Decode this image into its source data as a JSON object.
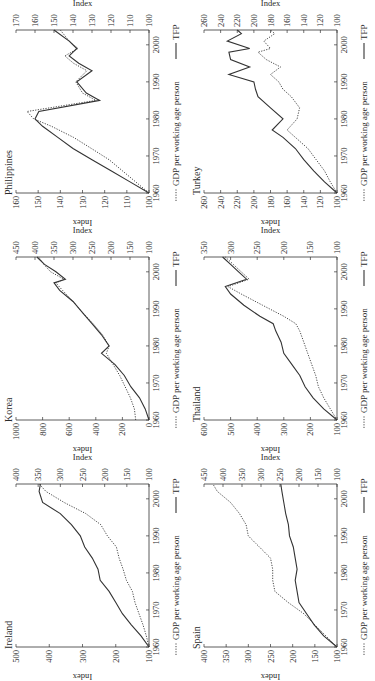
{
  "figure": {
    "orientation": "rotated 90deg counter-clockwise",
    "legend": {
      "dotted_label": "GDP per working age person",
      "solid_label": "TFP"
    },
    "left_axis_label": "Index",
    "right_axis_label": "Index",
    "colors": {
      "line": "#333333",
      "axis": "#333333",
      "background": "#ffffff"
    }
  },
  "chart_data": [
    {
      "type": "line",
      "title": "Ireland",
      "xlabel": "",
      "x_ticks": [
        1960,
        1970,
        1980,
        1990,
        2000
      ],
      "x_range": [
        1960,
        2004
      ],
      "left_axis": {
        "label": "Index",
        "range": [
          100,
          500
        ],
        "ticks": [
          100,
          200,
          300,
          400,
          500
        ],
        "series": "GDP per working age person"
      },
      "right_axis": {
        "label": "Index",
        "range": [
          100,
          400
        ],
        "ticks": [
          100,
          150,
          200,
          250,
          300,
          350,
          400
        ],
        "series": "TFP"
      },
      "series": [
        {
          "name": "GDP per working age person",
          "style": "dotted",
          "axis": "left",
          "x": [
            1960,
            1963,
            1966,
            1969,
            1972,
            1975,
            1978,
            1981,
            1984,
            1987,
            1990,
            1993,
            1996,
            1999,
            2002,
            2004
          ],
          "values": [
            100,
            108,
            118,
            130,
            142,
            150,
            168,
            178,
            190,
            198,
            225,
            245,
            290,
            355,
            410,
            430
          ]
        },
        {
          "name": "TFP",
          "style": "solid",
          "axis": "right",
          "x": [
            1960,
            1963,
            1966,
            1969,
            1972,
            1975,
            1978,
            1981,
            1984,
            1987,
            1990,
            1993,
            1996,
            1999,
            2002,
            2004
          ],
          "values": [
            100,
            118,
            140,
            160,
            175,
            190,
            210,
            215,
            228,
            245,
            255,
            275,
            300,
            340,
            348,
            345
          ]
        }
      ]
    },
    {
      "type": "line",
      "title": "Korea",
      "x_ticks": [
        1960,
        1970,
        1980,
        1990,
        2000
      ],
      "x_range": [
        1960,
        2004
      ],
      "left_axis": {
        "label": "Index",
        "range": [
          0,
          1000
        ],
        "ticks": [
          0,
          200,
          400,
          600,
          800,
          1000
        ],
        "series": "GDP per working age person"
      },
      "right_axis": {
        "label": "Index",
        "range": [
          100,
          450
        ],
        "ticks": [
          100,
          150,
          200,
          250,
          300,
          350,
          400,
          450
        ],
        "series": "TFP"
      },
      "series": [
        {
          "name": "GDP per working age person",
          "style": "dotted",
          "axis": "left",
          "x": [
            1960,
            1963,
            1966,
            1969,
            1972,
            1975,
            1978,
            1980,
            1983,
            1986,
            1989,
            1992,
            1995,
            1997,
            1998,
            2000,
            2002,
            2004
          ],
          "values": [
            100,
            110,
            140,
            180,
            220,
            270,
            320,
            300,
            350,
            420,
            500,
            570,
            650,
            700,
            640,
            740,
            790,
            830
          ]
        },
        {
          "name": "TFP",
          "style": "solid",
          "axis": "right",
          "x": [
            1960,
            1963,
            1966,
            1969,
            1972,
            1975,
            1978,
            1980,
            1983,
            1986,
            1989,
            1992,
            1995,
            1997,
            1998,
            2000,
            2002,
            2004
          ],
          "values": [
            100,
            110,
            125,
            148,
            165,
            190,
            225,
            205,
            225,
            250,
            275,
            300,
            335,
            350,
            320,
            345,
            375,
            395
          ]
        }
      ]
    },
    {
      "type": "line",
      "title": "Philippines",
      "x_ticks": [
        1960,
        1970,
        1980,
        1990,
        2000
      ],
      "x_range": [
        1960,
        2004
      ],
      "left_axis": {
        "label": "Index",
        "range": [
          100,
          160
        ],
        "ticks": [
          100,
          110,
          120,
          130,
          140,
          150,
          160
        ],
        "series": "GDP per working age person"
      },
      "right_axis": {
        "label": "Index",
        "range": [
          100,
          170
        ],
        "ticks": [
          100,
          110,
          120,
          130,
          140,
          150,
          160,
          170
        ],
        "series": "TFP"
      },
      "series": [
        {
          "name": "GDP per working age person",
          "style": "dotted",
          "axis": "left",
          "x": [
            1960,
            1963,
            1966,
            1969,
            1972,
            1975,
            1978,
            1980,
            1982,
            1985,
            1987,
            1990,
            1993,
            1995,
            1997,
            1999,
            2001,
            2004
          ],
          "values": [
            100,
            106,
            112,
            118,
            126,
            134,
            144,
            152,
            155,
            124,
            130,
            133,
            128,
            134,
            138,
            132,
            136,
            140
          ]
        },
        {
          "name": "TFP",
          "style": "solid",
          "axis": "right",
          "x": [
            1960,
            1963,
            1966,
            1969,
            1972,
            1975,
            1978,
            1980,
            1982,
            1985,
            1987,
            1990,
            1993,
            1995,
            1997,
            1999,
            2001,
            2004
          ],
          "values": [
            100,
            110,
            120,
            130,
            140,
            148,
            156,
            160,
            158,
            126,
            133,
            138,
            130,
            137,
            142,
            138,
            142,
            150
          ]
        }
      ]
    },
    {
      "type": "line",
      "title": "Spain",
      "x_ticks": [
        1960,
        1970,
        1980,
        1990,
        2000
      ],
      "x_range": [
        1960,
        2004
      ],
      "left_axis": {
        "label": "Index",
        "range": [
          100,
          400
        ],
        "ticks": [
          100,
          150,
          200,
          250,
          300,
          350,
          400
        ],
        "series": "GDP per working age person"
      },
      "right_axis": {
        "label": "Index",
        "range": [
          100,
          450
        ],
        "ticks": [
          100,
          150,
          200,
          250,
          300,
          350,
          400,
          450
        ],
        "series": "TFP"
      },
      "series": [
        {
          "name": "GDP per working age person",
          "style": "dotted",
          "axis": "left",
          "x": [
            1960,
            1963,
            1966,
            1969,
            1972,
            1975,
            1978,
            1981,
            1984,
            1987,
            1990,
            1993,
            1996,
            1999,
            2002,
            2004
          ],
          "values": [
            100,
            125,
            150,
            175,
            210,
            240,
            245,
            245,
            250,
            275,
            300,
            305,
            320,
            340,
            370,
            380
          ]
        },
        {
          "name": "TFP",
          "style": "solid",
          "axis": "right",
          "x": [
            1960,
            1963,
            1966,
            1969,
            1972,
            1975,
            1978,
            1981,
            1984,
            1987,
            1990,
            1993,
            1996,
            1999,
            2002,
            2004
          ],
          "values": [
            100,
            135,
            160,
            180,
            200,
            205,
            210,
            205,
            210,
            215,
            225,
            228,
            235,
            240,
            245,
            248
          ]
        }
      ]
    },
    {
      "type": "line",
      "title": "Thailand",
      "x_ticks": [
        1960,
        1970,
        1980,
        1990,
        2000
      ],
      "x_range": [
        1960,
        2004
      ],
      "left_axis": {
        "label": "Index",
        "range": [
          100,
          600
        ],
        "ticks": [
          100,
          200,
          300,
          400,
          500,
          600
        ],
        "series": "GDP per working age person"
      },
      "right_axis": {
        "label": "Index",
        "range": [
          100,
          350
        ],
        "ticks": [
          100,
          150,
          200,
          250,
          300,
          350
        ],
        "series": "TFP"
      },
      "series": [
        {
          "name": "GDP per working age person",
          "style": "dotted",
          "axis": "left",
          "x": [
            1960,
            1963,
            1966,
            1969,
            1972,
            1975,
            1978,
            1981,
            1984,
            1986,
            1988,
            1991,
            1994,
            1996,
            1998,
            2000,
            2002,
            2004
          ],
          "values": [
            100,
            125,
            150,
            170,
            180,
            195,
            210,
            225,
            240,
            255,
            300,
            380,
            460,
            510,
            430,
            460,
            490,
            520
          ]
        },
        {
          "name": "TFP",
          "style": "solid",
          "axis": "right",
          "x": [
            1960,
            1963,
            1966,
            1969,
            1972,
            1975,
            1978,
            1981,
            1984,
            1986,
            1988,
            1991,
            1994,
            1996,
            1998,
            2000,
            2002,
            2004
          ],
          "values": [
            100,
            125,
            145,
            160,
            170,
            185,
            200,
            205,
            215,
            220,
            245,
            275,
            300,
            310,
            270,
            285,
            300,
            315
          ]
        }
      ]
    },
    {
      "type": "line",
      "title": "Turkey",
      "x_ticks": [
        1960,
        1970,
        1980,
        1990,
        2000
      ],
      "x_range": [
        1960,
        2004
      ],
      "left_axis": {
        "label": "Index",
        "range": [
          100,
          260
        ],
        "ticks": [
          100,
          120,
          140,
          160,
          180,
          200,
          220,
          240,
          260
        ],
        "series": "GDP per working age person"
      },
      "right_axis": {
        "label": "Index",
        "range": [
          100,
          260
        ],
        "ticks": [
          100,
          120,
          140,
          160,
          180,
          200,
          220,
          240,
          260
        ],
        "series": "TFP"
      },
      "series": [
        {
          "name": "GDP per working age person",
          "style": "dotted",
          "axis": "left",
          "x": [
            1960,
            1963,
            1966,
            1969,
            1972,
            1975,
            1977,
            1980,
            1983,
            1986,
            1988,
            1990,
            1992,
            1994,
            1996,
            1998,
            1999,
            2001,
            2003,
            2004
          ],
          "values": [
            100,
            108,
            115,
            125,
            135,
            150,
            160,
            148,
            145,
            155,
            165,
            170,
            180,
            168,
            185,
            195,
            180,
            188,
            175,
            180
          ]
        },
        {
          "name": "TFP",
          "style": "solid",
          "axis": "right",
          "x": [
            1960,
            1963,
            1966,
            1969,
            1972,
            1975,
            1977,
            1980,
            1983,
            1986,
            1988,
            1990,
            1992,
            1994,
            1996,
            1998,
            1999,
            2001,
            2003,
            2004
          ],
          "values": [
            100,
            115,
            128,
            140,
            150,
            165,
            178,
            165,
            180,
            195,
            198,
            200,
            230,
            205,
            228,
            230,
            205,
            232,
            215,
            220
          ]
        }
      ]
    }
  ]
}
